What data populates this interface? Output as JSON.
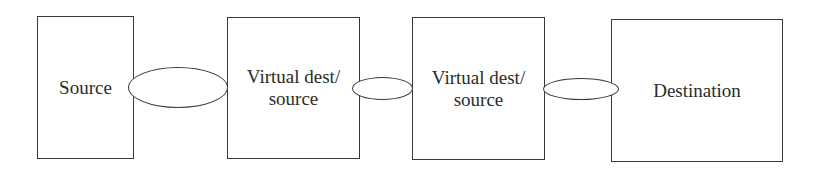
{
  "diagram": {
    "nodes": [
      {
        "id": "source",
        "label": "Source"
      },
      {
        "id": "virtual-1",
        "label_line1": "Virtual dest/",
        "label_line2": "source"
      },
      {
        "id": "virtual-2",
        "label_line1": "Virtual dest/",
        "label_line2": "source"
      },
      {
        "id": "destination",
        "label": "Destination"
      }
    ],
    "links": [
      {
        "from": "source",
        "to": "virtual-1",
        "shape": "ellipse"
      },
      {
        "from": "virtual-1",
        "to": "virtual-2",
        "shape": "ellipse"
      },
      {
        "from": "virtual-2",
        "to": "destination",
        "shape": "ellipse"
      }
    ],
    "colors": {
      "stroke": "#3a3a3a",
      "text": "#2b2b2b",
      "background": "#ffffff"
    }
  }
}
